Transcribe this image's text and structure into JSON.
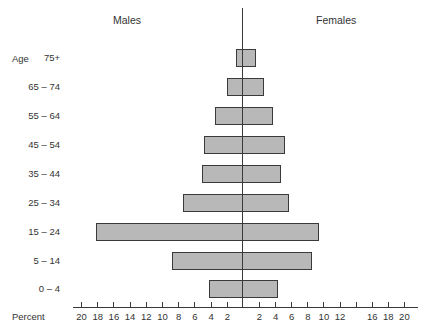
{
  "chart_data": {
    "type": "bar",
    "subtype": "population-pyramid",
    "title": "",
    "left_header": "Males",
    "right_header": "Females",
    "ylabel": "Age",
    "xlabel": "Percent",
    "categories": [
      "75+",
      "65 – 74",
      "55 – 64",
      "45 – 54",
      "35 – 44",
      "25 – 34",
      "15 – 24",
      "5 – 14",
      "0 – 4"
    ],
    "series": [
      {
        "name": "Males",
        "side": "left",
        "values": [
          0.9,
          2.0,
          3.5,
          4.8,
          5.1,
          7.4,
          18.2,
          8.8,
          4.2
        ]
      },
      {
        "name": "Females",
        "side": "right",
        "values": [
          1.6,
          2.6,
          3.7,
          5.2,
          4.7,
          5.7,
          9.5,
          8.6,
          4.3
        ]
      }
    ],
    "xlim": [
      -20,
      20
    ],
    "left_ticks": [
      "20",
      "18",
      "16",
      "14",
      "12",
      "10",
      "8",
      "6",
      "4",
      "2"
    ],
    "right_ticks": [
      "2",
      "4",
      "6",
      "8",
      "10",
      "12",
      "",
      "16",
      "18",
      "20"
    ],
    "grid": false,
    "legend": "none",
    "bar_color": "#b8b8b8",
    "edge_color": "#3a3a3a"
  },
  "labels": {
    "males": "Males",
    "females": "Females",
    "age": "Age",
    "percent": "Percent"
  }
}
